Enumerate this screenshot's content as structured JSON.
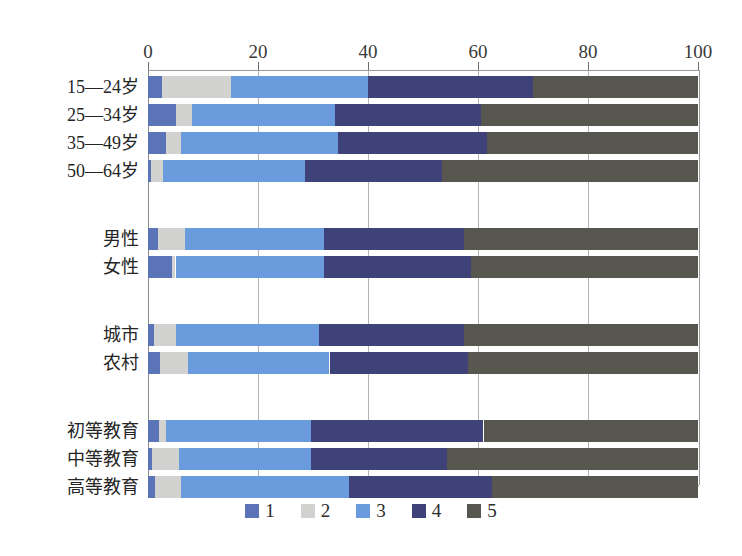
{
  "chart_data": {
    "type": "bar",
    "orientation": "horizontal",
    "stacked": true,
    "title": "",
    "subtitle": "",
    "xlabel": "",
    "ylabel": "",
    "xlim": [
      0,
      100
    ],
    "xticks": [
      0,
      20,
      40,
      60,
      80,
      100
    ],
    "xtick_labels": [
      "0",
      "20",
      "40",
      "60",
      "80",
      "100"
    ],
    "grid": true,
    "grid_axis": "x",
    "legend_position": "bottom-center",
    "legend": [
      "1",
      "2",
      "3",
      "4",
      "5"
    ],
    "colors": {
      "series1": "#5b74b8",
      "series2": "#d2d2d0",
      "series3": "#6a9bdc",
      "series4": "#3f4279",
      "series5": "#57574f"
    },
    "categories": [
      "15—24岁",
      "25—34岁",
      "35—49岁",
      "50—64岁",
      "男性",
      "女性",
      "城市",
      "农村",
      "初等教育",
      "中等教育",
      "高等教育"
    ],
    "group_breaks_after": [
      "50—64岁",
      "女性",
      "农村"
    ],
    "series": [
      {
        "name": "1",
        "color": "#5b74b8",
        "values": [
          2.5,
          5.0,
          3.3,
          0.5,
          1.9,
          4.3,
          1.0,
          2.2,
          2.0,
          0.7,
          1.3
        ]
      },
      {
        "name": "2",
        "color": "#d2d2d0",
        "values": [
          12.5,
          3.0,
          2.7,
          2.2,
          4.8,
          0.7,
          4.0,
          5.1,
          1.3,
          4.9,
          4.7
        ]
      },
      {
        "name": "3",
        "color": "#6a9bdc",
        "values": [
          25.0,
          26.0,
          28.5,
          25.8,
          25.3,
          27.0,
          26.0,
          25.7,
          26.3,
          24.0,
          30.5
        ]
      },
      {
        "name": "4",
        "color": "#3f4279",
        "values": [
          30.0,
          26.5,
          27.1,
          25.0,
          25.5,
          26.7,
          26.5,
          25.1,
          31.4,
          24.8,
          26.0
        ]
      },
      {
        "name": "5",
        "color": "#57574f",
        "values": [
          30.0,
          39.5,
          38.4,
          46.5,
          42.5,
          41.3,
          42.5,
          41.9,
          39.0,
          45.6,
          37.5
        ]
      }
    ]
  }
}
